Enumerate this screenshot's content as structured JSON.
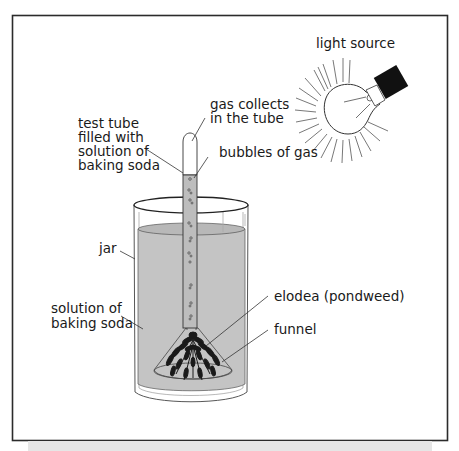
{
  "diagram": {
    "colors": {
      "frame": "#2b2b2b",
      "solution": "#c4c4c4",
      "line": "#333333",
      "plant": "#1a1a1a",
      "socket": "#111111",
      "background": "#ffffff",
      "shadow": "#e6e6e6"
    },
    "labels": {
      "light_source": "light source",
      "gas_collects_1": "gas collects",
      "gas_collects_2": "in the tube",
      "test_tube_1": "test tube",
      "test_tube_2": "filled with",
      "test_tube_3": "solution of",
      "test_tube_4": "baking soda",
      "bubbles": "bubbles of gas",
      "jar": "jar",
      "solution_1": "solution of",
      "solution_2": "baking soda",
      "elodea": "elodea (pondweed)",
      "funnel": "funnel"
    }
  }
}
